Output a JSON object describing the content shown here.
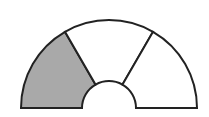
{
  "diagram": {
    "type": "half-annulus-partition",
    "center": [
      109,
      108
    ],
    "outer_radius": 88,
    "inner_radius": 27,
    "sectors": [
      {
        "index": 0,
        "start_deg": 180,
        "end_deg": 120,
        "fill": "#a9a9a9",
        "shaded": true
      },
      {
        "index": 1,
        "start_deg": 120,
        "end_deg": 60,
        "fill": "#ffffff",
        "shaded": false
      },
      {
        "index": 2,
        "start_deg": 60,
        "end_deg": 0,
        "fill": "#ffffff",
        "shaded": false
      }
    ],
    "stroke": "#222222",
    "stroke_width": 2,
    "shaded_fraction": "1/3"
  }
}
